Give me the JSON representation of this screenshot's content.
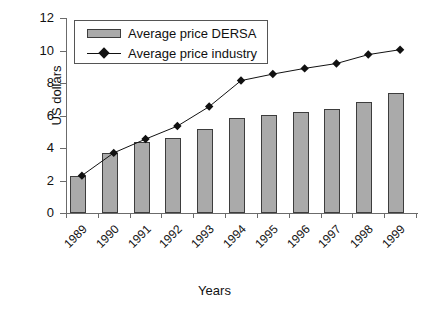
{
  "chart_data": {
    "type": "bar",
    "title": "",
    "xlabel": "Years",
    "ylabel": "US dollars",
    "categories": [
      "1989",
      "1990",
      "1991",
      "1992",
      "1993",
      "1994",
      "1995",
      "1996",
      "1997",
      "1998",
      "1999"
    ],
    "ylim": [
      0,
      12
    ],
    "ytick_labels": [
      "0",
      "2",
      "4",
      "6",
      "8",
      "10",
      "12"
    ],
    "yticks": [
      0,
      2,
      4,
      6,
      8,
      10,
      12
    ],
    "grid": false,
    "legend_position": "top-left",
    "series": [
      {
        "name": "Average price DERSA",
        "type": "bar",
        "color": "#aaaaaa",
        "values": [
          2.3,
          3.7,
          4.35,
          4.6,
          5.2,
          5.85,
          6.05,
          6.2,
          6.4,
          6.85,
          7.4
        ]
      },
      {
        "name": "Average price industry",
        "type": "line",
        "color": "#111111",
        "marker": "diamond",
        "values": [
          2.3,
          3.7,
          4.55,
          5.35,
          6.55,
          8.15,
          8.55,
          8.9,
          9.2,
          9.75,
          10.05
        ]
      }
    ]
  },
  "legend": {
    "items": [
      {
        "label": "Average price DERSA",
        "swatch": "bar-swatch"
      },
      {
        "label": "Average price industry",
        "swatch": "line-diamond-swatch"
      }
    ]
  },
  "axes": {
    "y_title": "US dollars",
    "x_title": "Years"
  }
}
